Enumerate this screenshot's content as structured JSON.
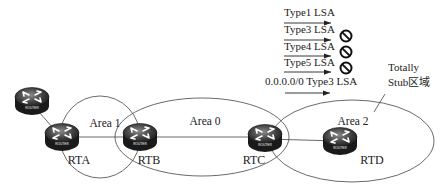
{
  "routers": [
    {
      "id": "external",
      "label": "",
      "badge": "ROUTER"
    },
    {
      "id": "rta",
      "label": "RTA",
      "badge": "ROUTER"
    },
    {
      "id": "rtb",
      "label": "RTB",
      "badge": "ROUTER"
    },
    {
      "id": "rtc",
      "label": "RTC",
      "badge": "ROUTER"
    },
    {
      "id": "rtd",
      "label": "RTD",
      "badge": "ROUTER"
    }
  ],
  "areas": [
    {
      "id": "area1",
      "label": "Area 1"
    },
    {
      "id": "area0",
      "label": "Area 0"
    },
    {
      "id": "area2",
      "label": "Area 2"
    }
  ],
  "lsa_list": [
    {
      "label": "Type1 LSA",
      "blocked": false
    },
    {
      "label": "Type3 LSA",
      "blocked": true
    },
    {
      "label": "Type4 LSA",
      "blocked": true
    },
    {
      "label": "Type5 LSA",
      "blocked": true
    },
    {
      "label": "0.0.0.0/0 Type3 LSA",
      "blocked": false
    }
  ],
  "annotation": {
    "line1": "Totally",
    "line2": "Stub区域"
  }
}
